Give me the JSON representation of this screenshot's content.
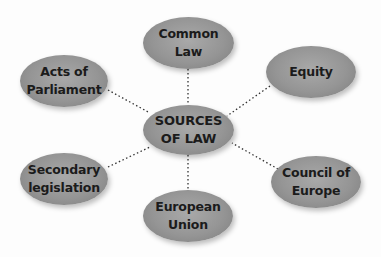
{
  "diagram": {
    "center": {
      "label": "SOURCES\nOF LAW",
      "cx": 188,
      "cy": 130
    },
    "nodes": [
      {
        "id": "common-law",
        "label": "Common\nLaw",
        "cx": 188,
        "cy": 43
      },
      {
        "id": "acts-of-parliament",
        "label": "Acts of\nParliament",
        "cx": 64,
        "cy": 81
      },
      {
        "id": "equity",
        "label": "Equity",
        "cx": 311,
        "cy": 72
      },
      {
        "id": "secondary-legislation",
        "label": "Secondary\nlegislation",
        "cx": 64,
        "cy": 179
      },
      {
        "id": "council-of-europe",
        "label": "Council of\nEurope",
        "cx": 316,
        "cy": 182
      },
      {
        "id": "european-union",
        "label": "European\nUnion",
        "cx": 188,
        "cy": 216
      }
    ],
    "colors": {
      "node": "#959595",
      "text": "#1b1b1b",
      "link": "#333333"
    }
  }
}
